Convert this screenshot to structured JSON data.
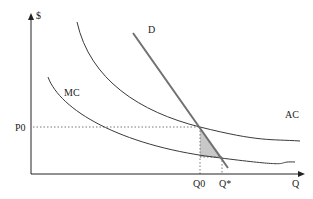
{
  "diagram": {
    "type": "economics-cost-demand",
    "axes": {
      "y_label": "$",
      "x_label": "Q"
    },
    "curves": {
      "demand": {
        "label": "D",
        "color": "#707070"
      },
      "average_cost": {
        "label": "AC",
        "color": "#3a3a3a"
      },
      "marginal_cost": {
        "label": "MC",
        "color": "#3a3a3a"
      }
    },
    "markers": {
      "price_level": "P0",
      "quantity_regulated": "Q0",
      "quantity_optimal": "Q*"
    },
    "shaded_region": {
      "description": "deadweight loss triangle",
      "color": "#c8c8c8"
    }
  }
}
